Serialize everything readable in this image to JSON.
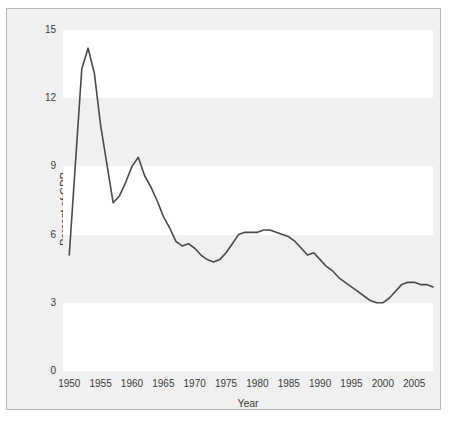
{
  "chart_data": {
    "type": "line",
    "title": "",
    "xlabel": "Year",
    "ylabel": "Percent of GDP",
    "xlim": [
      1949,
      2008
    ],
    "ylim": [
      0,
      15
    ],
    "grid": false,
    "banded_background": true,
    "legend": null,
    "line_color": "#4a4a4a",
    "xticks": [
      "1950",
      "1955",
      "1960",
      "1965",
      "1970",
      "1975",
      "1980",
      "1985",
      "1990",
      "1995",
      "2000",
      "2005"
    ],
    "xtick_values": [
      1950,
      1955,
      1960,
      1965,
      1970,
      1975,
      1980,
      1985,
      1990,
      1995,
      2000,
      2005
    ],
    "yticks": [
      "0",
      "3",
      "6",
      "9",
      "12",
      "15"
    ],
    "ytick_values": [
      0,
      3,
      6,
      9,
      12,
      15
    ],
    "x": [
      1950,
      1951,
      1952,
      1953,
      1954,
      1955,
      1956,
      1957,
      1958,
      1959,
      1960,
      1961,
      1962,
      1963,
      1964,
      1965,
      1966,
      1967,
      1968,
      1969,
      1970,
      1971,
      1972,
      1973,
      1974,
      1975,
      1976,
      1977,
      1978,
      1979,
      1980,
      1981,
      1982,
      1983,
      1984,
      1985,
      1986,
      1987,
      1988,
      1989,
      1990,
      1991,
      1992,
      1993,
      1994,
      1995,
      1996,
      1997,
      1998,
      1999,
      2000,
      2001,
      2002,
      2003,
      2004,
      2005,
      2006,
      2007,
      2008
    ],
    "values": [
      5.1,
      9.2,
      13.3,
      14.2,
      13.1,
      10.8,
      9.1,
      7.4,
      7.7,
      8.3,
      9.0,
      9.4,
      8.6,
      8.1,
      7.5,
      6.8,
      6.3,
      5.7,
      5.5,
      5.6,
      5.4,
      5.1,
      4.9,
      4.8,
      4.9,
      5.2,
      5.6,
      6.0,
      6.1,
      6.1,
      6.1,
      6.2,
      6.2,
      6.1,
      6.0,
      5.9,
      5.7,
      5.4,
      5.1,
      5.2,
      4.9,
      4.6,
      4.4,
      4.1,
      3.9,
      3.7,
      3.5,
      3.3,
      3.1,
      3.0,
      3.0,
      3.2,
      3.5,
      3.8,
      3.9,
      3.9,
      3.8,
      3.8,
      3.7
    ]
  }
}
